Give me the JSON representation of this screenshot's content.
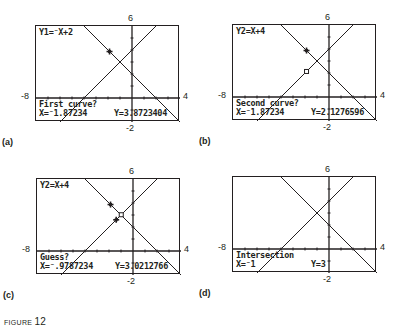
{
  "figure": {
    "caption_prefix": "FIGURE",
    "caption_number": "12"
  },
  "window": {
    "xmin": "-8",
    "xmax": "4",
    "ymin": "-2",
    "ymax": "6"
  },
  "panels": [
    {
      "id": "a",
      "label": "(a)",
      "top_text": "Y1=⁻X+2",
      "prompt": "First curve?",
      "x_readout": "X=⁻1.87234",
      "y_readout": "Y=3.8723404",
      "marker": "cross-on-Y1"
    },
    {
      "id": "b",
      "label": "(b)",
      "top_text": "Y2=X+4",
      "prompt": "Second curve?",
      "x_readout": "X=⁻1.87234",
      "y_readout": "Y=2.1276596",
      "marker": "cross-on-Y1, box-on-Y2"
    },
    {
      "id": "c",
      "label": "(c)",
      "top_text": "Y2=X+4",
      "prompt": "Guess?",
      "x_readout": "X=⁻.9787234",
      "y_readout": "Y=3.0212766",
      "marker": "crosses-on-both, box-near-intersection"
    },
    {
      "id": "d",
      "label": "(d)",
      "top_text": "",
      "prompt": "Intersection",
      "x_readout": "X=⁻1",
      "y_readout": "Y=3",
      "marker": "none"
    }
  ],
  "chart_data": {
    "type": "line",
    "xlabel": "",
    "ylabel": "",
    "xlim": [
      -8,
      4
    ],
    "ylim": [
      -2,
      6
    ],
    "grid": false,
    "series": [
      {
        "name": "Y1 = -X+2",
        "x": [
          -8,
          4
        ],
        "y": [
          10,
          -2
        ]
      },
      {
        "name": "Y2 = X+4",
        "x": [
          -8,
          4
        ],
        "y": [
          -4,
          8
        ]
      }
    ],
    "intersection": {
      "x": -1,
      "y": 3
    },
    "tick_labels": {
      "top": "6",
      "bottom": "-2",
      "left": "-8",
      "right": "4"
    }
  }
}
